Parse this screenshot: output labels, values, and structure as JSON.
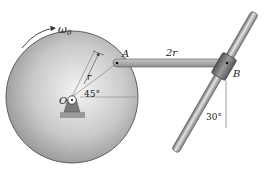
{
  "diagram": {
    "labels": {
      "omega": "ω",
      "omega_sub": "0",
      "point_A": "A",
      "point_B": "B",
      "point_O": "O",
      "radius": "r",
      "link_length": "2r",
      "angle_disk": "45°",
      "angle_rod": "30°"
    },
    "colors": {
      "disk_light": "#f2f2f2",
      "disk_dark": "#8c8c8c",
      "link": "#a8a8a8",
      "rod": "#9a9a9a",
      "collar": "#6e6e6e",
      "outline": "#333333"
    }
  }
}
